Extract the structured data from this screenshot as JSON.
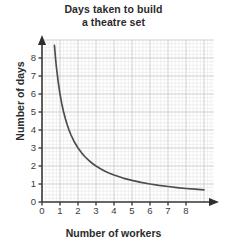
{
  "chart_data": {
    "type": "line",
    "title": "Days taken to build a theatre set",
    "title_lines": [
      "Days taken to build",
      "a theatre set"
    ],
    "xlabel": "Number of workers",
    "ylabel": "Number of days",
    "xlim": [
      0,
      9
    ],
    "ylim": [
      0,
      8.6
    ],
    "xticks": [
      "0",
      "1",
      "2",
      "3",
      "4",
      "5",
      "6",
      "7",
      "8"
    ],
    "yticks": [
      "0",
      "1",
      "2",
      "3",
      "4",
      "5",
      "6",
      "7",
      "8"
    ],
    "grid": true,
    "grid_minor": true,
    "legend": "none",
    "relationship": "inverse proportion y = 6 / x",
    "constant_k": 6,
    "series": [
      {
        "name": "days vs workers",
        "color": "#4d4d4d",
        "x": [
          0.69,
          0.75,
          0.8,
          0.9,
          1.0,
          1.1,
          1.2,
          1.3,
          1.4,
          1.5,
          1.6,
          1.8,
          2.0,
          2.2,
          2.4,
          2.6,
          2.8,
          3.0,
          3.25,
          3.5,
          3.75,
          4.0,
          4.5,
          5.0,
          5.5,
          6.0,
          6.5,
          7.0,
          7.5,
          8.0,
          8.5,
          9.0
        ],
        "y": [
          8.7,
          8.0,
          7.5,
          6.67,
          6.0,
          5.45,
          5.0,
          4.62,
          4.29,
          4.0,
          3.75,
          3.33,
          3.0,
          2.73,
          2.5,
          2.31,
          2.14,
          2.0,
          1.85,
          1.71,
          1.6,
          1.5,
          1.33,
          1.2,
          1.09,
          1.0,
          0.92,
          0.86,
          0.8,
          0.75,
          0.71,
          0.67
        ]
      }
    ],
    "key_points": [
      {
        "x": 1,
        "y": 6
      },
      {
        "x": 2,
        "y": 3
      },
      {
        "x": 3,
        "y": 2
      },
      {
        "x": 4,
        "y": 1.5
      },
      {
        "x": 6,
        "y": 1
      },
      {
        "x": 8,
        "y": 0.75
      }
    ],
    "colors": {
      "curve": "#4d4d4d",
      "axis": "#3d3d3d",
      "grid_major": "#c9c9c9",
      "grid_minor": "#e2e2e2",
      "text": "#2b2b2b",
      "background": "#ffffff"
    }
  }
}
